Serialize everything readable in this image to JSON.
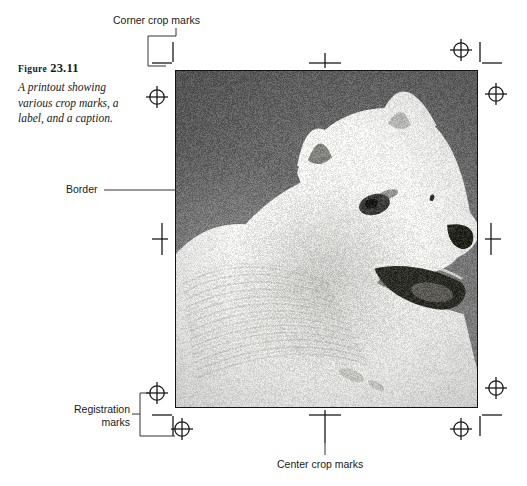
{
  "figure": {
    "label_prefix": "Figure",
    "label_number": "23.11",
    "caption": "A printout showing various crop marks, a label, and a caption."
  },
  "annotations": {
    "corner_crop_marks": "Corner crop marks",
    "border": "Border",
    "registration_marks": "Registration marks",
    "center_crop_marks": "Center crop marks"
  },
  "photo": {
    "subject": "white samoyed dog in profile",
    "alt": "Black and white photograph of a white Samoyed dog facing right against a dark gray background",
    "background_color": "#6f6f6f",
    "border_color": "#141414"
  },
  "colors": {
    "page_background": "#ffffff",
    "ink": "#1a1a1a",
    "leader_line": "#333333"
  },
  "marks": {
    "registration_mark_count": 4,
    "center_crop_mark_count": 4,
    "corner_crop_mark_sets": 4
  }
}
